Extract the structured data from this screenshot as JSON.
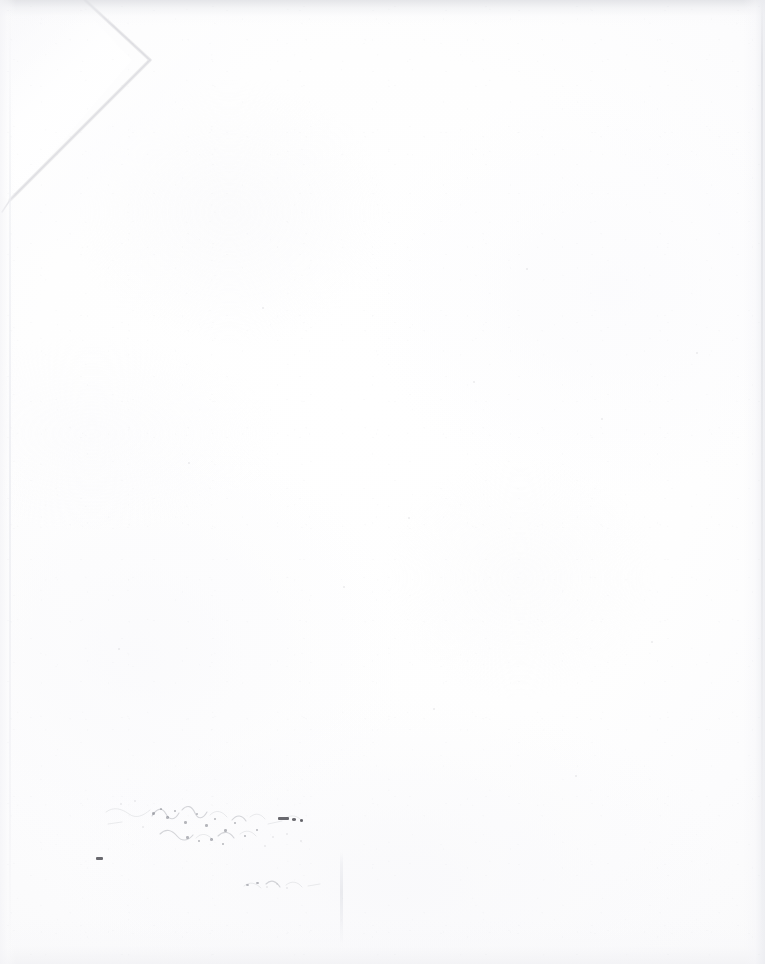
{
  "document": {
    "kind": "scanned-paper-sheet",
    "surface": "blank white page (verso / back side)",
    "width_px": 765,
    "height_px": 964,
    "visible_text": "",
    "legible_text_present": false,
    "note_on_text": "No legible printed or handwritten text is rendered on this side of the sheet."
  },
  "colors": {
    "paper_white": "#ffffff",
    "paper_offwhite": "#fcfcfd",
    "edge_shadow": "#dedee3",
    "crease_line": "#dedee3",
    "ink_dark": "#303038",
    "ink_mid": "#60626c",
    "ghost_text": "#96989f"
  },
  "features": {
    "dogear": {
      "name": "folded top-left corner",
      "apex_x": 85,
      "apex_y": 0,
      "outer_x": 150,
      "outer_y": 60,
      "foot_x": 10,
      "foot_y": 200
    },
    "bottom_crease": {
      "name": "vertical crease line near bottom centre",
      "x": 341,
      "y_start": 852,
      "y_end": 948
    },
    "edges": {
      "top_shadow": true,
      "bottom_shadow": true,
      "left_hairline": true,
      "right_hairline": true
    }
  },
  "ghost_text": {
    "description": "Extremely faint mirrored show-through of printing from the other side of the sheet, across the upper portion of the page. Individual characters are not resolvable.",
    "line_1": "              ",
    "line_2": "          ",
    "line_3": "        "
  },
  "marks": {
    "description": "Scattered ink speckles and a faint offset transfer of handwriting in the lower-left quadrant; individual words are not legible.",
    "cluster_label": "",
    "secondary_label": ""
  },
  "specks": [
    {
      "x": 96,
      "y": 857,
      "w": 7,
      "h": 3,
      "tone": "dark"
    },
    {
      "x": 278,
      "y": 817,
      "w": 11,
      "h": 3,
      "tone": "dark"
    },
    {
      "x": 292,
      "y": 818,
      "w": 4,
      "h": 2.5,
      "tone": "dark"
    },
    {
      "x": 300,
      "y": 819,
      "w": 3,
      "h": 2.5,
      "tone": "dark"
    },
    {
      "x": 152,
      "y": 812,
      "w": 2.5,
      "h": 2.5,
      "tone": "mid"
    },
    {
      "x": 160,
      "y": 808,
      "w": 2,
      "h": 2,
      "tone": "mid"
    },
    {
      "x": 166,
      "y": 816,
      "w": 2.5,
      "h": 2.5,
      "tone": "mid"
    },
    {
      "x": 174,
      "y": 810,
      "w": 2,
      "h": 2,
      "tone": "mid"
    },
    {
      "x": 184,
      "y": 821,
      "w": 2.5,
      "h": 2.5,
      "tone": "mid"
    },
    {
      "x": 196,
      "y": 813,
      "w": 2,
      "h": 2,
      "tone": "mid"
    },
    {
      "x": 205,
      "y": 824,
      "w": 2.5,
      "h": 2.5,
      "tone": "mid"
    },
    {
      "x": 214,
      "y": 818,
      "w": 2,
      "h": 2,
      "tone": "mid"
    },
    {
      "x": 224,
      "y": 829,
      "w": 2.5,
      "h": 2.5,
      "tone": "mid"
    },
    {
      "x": 234,
      "y": 822,
      "w": 2,
      "h": 2,
      "tone": "mid"
    },
    {
      "x": 186,
      "y": 836,
      "w": 2.5,
      "h": 2.5,
      "tone": "mid"
    },
    {
      "x": 198,
      "y": 840,
      "w": 2,
      "h": 2,
      "tone": "mid"
    },
    {
      "x": 210,
      "y": 838,
      "w": 2.5,
      "h": 2.5,
      "tone": "mid"
    },
    {
      "x": 222,
      "y": 843,
      "w": 2,
      "h": 2,
      "tone": "mid"
    },
    {
      "x": 244,
      "y": 835,
      "w": 2,
      "h": 2,
      "tone": "mid"
    },
    {
      "x": 256,
      "y": 829,
      "w": 2,
      "h": 2,
      "tone": "mid"
    },
    {
      "x": 120,
      "y": 803,
      "w": 2,
      "h": 2,
      "tone": "faint"
    },
    {
      "x": 134,
      "y": 800,
      "w": 2,
      "h": 2,
      "tone": "faint"
    },
    {
      "x": 142,
      "y": 826,
      "w": 2,
      "h": 2,
      "tone": "faint"
    },
    {
      "x": 264,
      "y": 845,
      "w": 2,
      "h": 2,
      "tone": "faint"
    },
    {
      "x": 272,
      "y": 836,
      "w": 2,
      "h": 2,
      "tone": "faint"
    },
    {
      "x": 286,
      "y": 833,
      "w": 2,
      "h": 2,
      "tone": "faint"
    },
    {
      "x": 300,
      "y": 840,
      "w": 2,
      "h": 2,
      "tone": "faint"
    },
    {
      "x": 246,
      "y": 884,
      "w": 3,
      "h": 2,
      "tone": "mid"
    },
    {
      "x": 256,
      "y": 882,
      "w": 2.5,
      "h": 2,
      "tone": "mid"
    },
    {
      "x": 266,
      "y": 886,
      "w": 2,
      "h": 2,
      "tone": "faint"
    },
    {
      "x": 276,
      "y": 883,
      "w": 2,
      "h": 2,
      "tone": "faint"
    },
    {
      "x": 286,
      "y": 887,
      "w": 2,
      "h": 2,
      "tone": "faint"
    },
    {
      "x": 408,
      "y": 517,
      "w": 2,
      "h": 2,
      "tone": "faint"
    },
    {
      "x": 473,
      "y": 381,
      "w": 2,
      "h": 2,
      "tone": "faint"
    },
    {
      "x": 601,
      "y": 418,
      "w": 2,
      "h": 2,
      "tone": "faint"
    },
    {
      "x": 343,
      "y": 586,
      "w": 2,
      "h": 2,
      "tone": "faint"
    },
    {
      "x": 188,
      "y": 462,
      "w": 2,
      "h": 2,
      "tone": "faint"
    },
    {
      "x": 651,
      "y": 641,
      "w": 2,
      "h": 2,
      "tone": "faint"
    },
    {
      "x": 262,
      "y": 307,
      "w": 2,
      "h": 2,
      "tone": "faint"
    },
    {
      "x": 526,
      "y": 268,
      "w": 2,
      "h": 2,
      "tone": "faint"
    },
    {
      "x": 433,
      "y": 708,
      "w": 2,
      "h": 2,
      "tone": "faint"
    },
    {
      "x": 696,
      "y": 352,
      "w": 2,
      "h": 2,
      "tone": "faint"
    },
    {
      "x": 118,
      "y": 648,
      "w": 2,
      "h": 2,
      "tone": "faint"
    },
    {
      "x": 575,
      "y": 775,
      "w": 2,
      "h": 2,
      "tone": "faint"
    }
  ]
}
